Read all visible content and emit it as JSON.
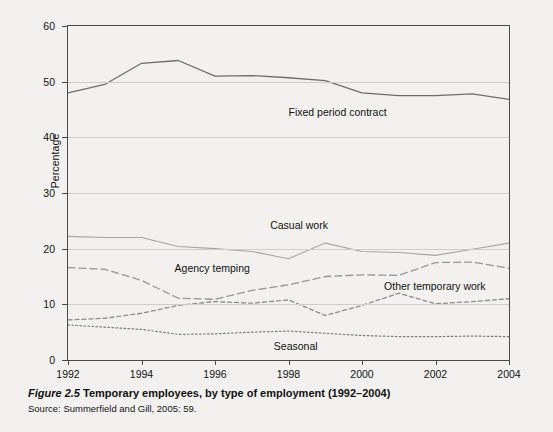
{
  "figure": {
    "number_label": "Figure 2.5",
    "caption": "Temporary employees, by type of employment (1992–2004)",
    "source": "Source: Summerfield and Gill, 2005: 59."
  },
  "chart_data": {
    "type": "line",
    "title": "Temporary employees, by type of employment (1992–2004)",
    "xlabel": "",
    "ylabel": "Percentage",
    "xlim": [
      1992,
      2004
    ],
    "ylim": [
      0,
      60
    ],
    "ytick_values": [
      0,
      10,
      20,
      30,
      40,
      50,
      60
    ],
    "ytick_labels": [
      "0",
      "10",
      "20",
      "30",
      "40",
      "50",
      "60"
    ],
    "xtick_values": [
      1992,
      1994,
      1996,
      1998,
      2000,
      2002,
      2004
    ],
    "xtick_labels": [
      "1992",
      "1994",
      "1996",
      "1998",
      "2000",
      "2002",
      "2004"
    ],
    "grid": "horizontal",
    "legend_position": "inline-labels",
    "x": [
      1992,
      1993,
      1994,
      1995,
      1996,
      1997,
      1998,
      1999,
      2000,
      2001,
      2002,
      2003,
      2004
    ],
    "series": [
      {
        "name": "Fixed period contract",
        "style": "solid",
        "color": "#6d6d6d",
        "width": 1.3,
        "label_x": 1998.0,
        "label_y": 44.3,
        "values": [
          48.0,
          49.5,
          53.3,
          53.8,
          51.0,
          51.1,
          50.7,
          50.2,
          48.0,
          47.5,
          47.5,
          47.8,
          46.8
        ]
      },
      {
        "name": "Casual work",
        "style": "solid",
        "color": "#a6a6a6",
        "width": 1.1,
        "label_x": 1997.5,
        "label_y": 24.0,
        "values": [
          22.2,
          22.0,
          22.0,
          20.4,
          20.0,
          19.5,
          18.2,
          21.0,
          19.5,
          19.3,
          18.8,
          19.9,
          21.0
        ]
      },
      {
        "name": "Agency temping",
        "style": "long-dash",
        "color": "#969696",
        "width": 1.3,
        "label_x": 1994.9,
        "label_y": 16.3,
        "values": [
          16.6,
          16.3,
          14.3,
          11.1,
          10.9,
          12.5,
          13.5,
          15.0,
          15.3,
          15.2,
          17.5,
          17.6,
          16.5
        ]
      },
      {
        "name": "Other temporary work",
        "style": "short-dash",
        "color": "#8c8c8c",
        "width": 1.3,
        "label_x": 2000.6,
        "label_y": 13.2,
        "values": [
          7.2,
          7.5,
          8.4,
          9.8,
          10.5,
          10.2,
          10.8,
          8.0,
          9.8,
          12.0,
          10.1,
          10.5,
          11.0
        ]
      },
      {
        "name": "Seasonal",
        "style": "dotted",
        "color": "#7d7d7d",
        "width": 1.2,
        "label_x": 1997.6,
        "label_y": 2.3,
        "values": [
          6.3,
          5.9,
          5.5,
          4.6,
          4.7,
          5.0,
          5.2,
          4.8,
          4.4,
          4.2,
          4.2,
          4.3,
          4.2
        ]
      }
    ]
  }
}
